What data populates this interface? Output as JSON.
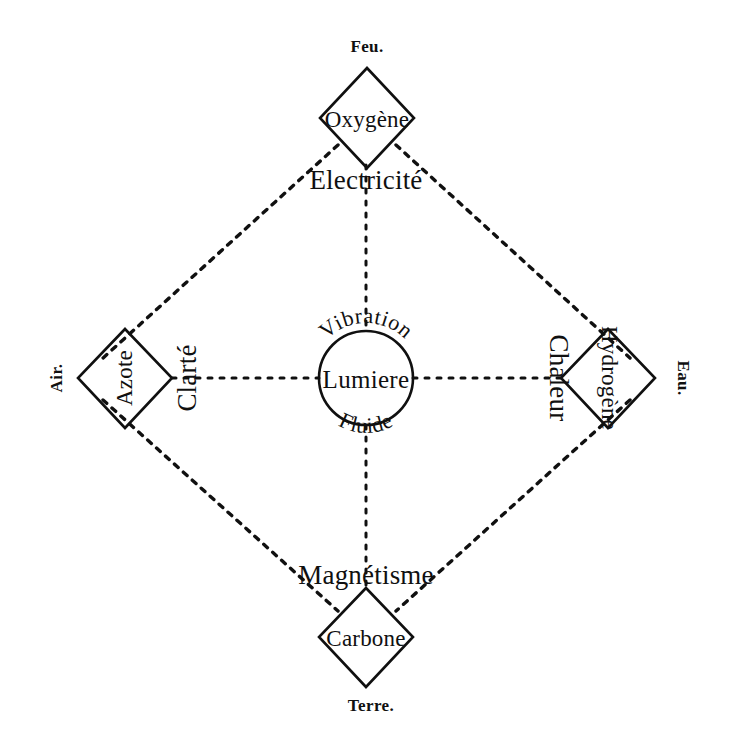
{
  "figure": {
    "kind": "alchemical-element-diagram",
    "language": "fr",
    "center": {
      "core_label": "Lumiere",
      "arc_top_label": "Vibration",
      "arc_bottom_label": "Fluide"
    },
    "nodes": [
      {
        "id": "oxygene",
        "position": "top",
        "substance": "Oxygène",
        "element": "Feu.",
        "force": "Electricité"
      },
      {
        "id": "azote",
        "position": "left",
        "substance": "Azote",
        "element": "Air.",
        "force": "Clarté"
      },
      {
        "id": "hydrogene",
        "position": "right",
        "substance": "Hydrogène",
        "element": "Eau.",
        "force": "Chaleur"
      },
      {
        "id": "carbone",
        "position": "bottom",
        "substance": "Carbone",
        "element": "Terre.",
        "force": "Magnétisme"
      }
    ],
    "colors": {
      "ink": "#101010",
      "paper": "#ffffff"
    }
  }
}
